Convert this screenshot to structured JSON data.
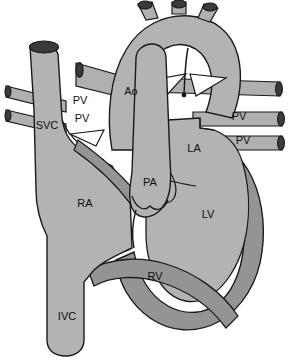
{
  "figure": {
    "type": "anatomical-line-diagram",
    "background_color": "#ffffff",
    "outline_color": "#1a1a1a",
    "chamber_fill": "#b3b3b3",
    "myocardium_fill": "#949494",
    "vessel_fill": "#b0b0b0",
    "lumen_fill": "#3a3a3a",
    "valve_fill": "#ffffff"
  },
  "labels": [
    {
      "id": "svc",
      "text": "SVC",
      "x": 47,
      "y": 129,
      "name": "superior-vena-cava"
    },
    {
      "id": "pv1",
      "text": "PV",
      "x": 80,
      "y": 104,
      "name": "pulmonary-vein-left-upper"
    },
    {
      "id": "pv2",
      "text": "PV",
      "x": 82,
      "y": 122,
      "name": "pulmonary-vein-left-lower"
    },
    {
      "id": "ao",
      "text": "Ao",
      "x": 131,
      "y": 95,
      "name": "aorta"
    },
    {
      "id": "pv3",
      "text": "PV",
      "x": 239,
      "y": 120,
      "name": "pulmonary-vein-right-upper"
    },
    {
      "id": "pv4",
      "text": "PV",
      "x": 243,
      "y": 144,
      "name": "pulmonary-vein-right-lower"
    },
    {
      "id": "la",
      "text": "LA",
      "x": 194,
      "y": 152,
      "name": "left-atrium"
    },
    {
      "id": "pa",
      "text": "PA",
      "x": 150,
      "y": 186,
      "name": "pulmonary-artery"
    },
    {
      "id": "ra",
      "text": "RA",
      "x": 85,
      "y": 207,
      "name": "right-atrium"
    },
    {
      "id": "lv",
      "text": "LV",
      "x": 208,
      "y": 218,
      "name": "left-ventricle"
    },
    {
      "id": "rv",
      "text": "RV",
      "x": 155,
      "y": 280,
      "name": "right-ventricle"
    },
    {
      "id": "ivc",
      "text": "IVC",
      "x": 67,
      "y": 320,
      "name": "inferior-vena-cava"
    }
  ]
}
